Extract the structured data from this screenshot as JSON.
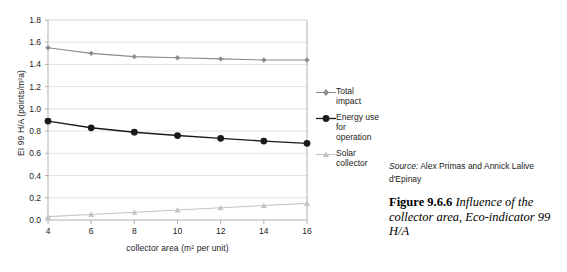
{
  "chart_data": {
    "type": "line",
    "title": "",
    "subtitle": "",
    "xlabel": "collector area (m² per unit)",
    "ylabel": "EI 99 H/A (points/m²a)",
    "x": [
      4,
      6,
      8,
      10,
      12,
      14,
      16
    ],
    "xlim": [
      4,
      16
    ],
    "ylim": [
      0.0,
      1.8
    ],
    "xticks": [
      "4",
      "6",
      "8",
      "10",
      "12",
      "14",
      "16"
    ],
    "yticks": [
      "0.0",
      "0.2",
      "0.4",
      "0.6",
      "0.8",
      "1.0",
      "1.2",
      "1.4",
      "1.6",
      "1.8"
    ],
    "grid": "horizontal",
    "legend_position": "right",
    "series": [
      {
        "name": "Total impact",
        "values": [
          1.55,
          1.5,
          1.47,
          1.46,
          1.45,
          1.44,
          1.44
        ],
        "color": "#8c8c8c",
        "marker": "diamond"
      },
      {
        "name": "Energy use for operation",
        "values": [
          0.89,
          0.83,
          0.79,
          0.76,
          0.735,
          0.71,
          0.69
        ],
        "color": "#1a1a1a",
        "marker": "circle"
      },
      {
        "name": "Solar collector",
        "values": [
          0.03,
          0.05,
          0.07,
          0.09,
          0.11,
          0.13,
          0.15
        ],
        "color": "#c4c4c4",
        "marker": "triangle"
      }
    ]
  },
  "legend": {
    "items": [
      {
        "label_line1": "Total",
        "label_line2": "impact",
        "label_line3": "",
        "marker": "diamond-marker",
        "color": "#8c8c8c"
      },
      {
        "label_line1": "Energy use",
        "label_line2": "for",
        "label_line3": "operation",
        "marker": "circle-marker",
        "color": "#1a1a1a"
      },
      {
        "label_line1": "Solar",
        "label_line2": "collector",
        "label_line3": "",
        "marker": "triangle-marker",
        "color": "#c4c4c4"
      }
    ]
  },
  "caption": {
    "source_prefix": "Source:",
    "source_text": " Alex Primas and Annick Lalive d'Epinay",
    "figure_number": "Figure 9.6.6",
    "figure_title": " Influence of the collector area, Eco-indicator 99 H/A"
  },
  "colors": {
    "axis": "#b0b0b0",
    "grid": "#e2e2e2",
    "text": "#222222",
    "total_impact": "#8c8c8c",
    "energy_use": "#1a1a1a",
    "solar_collector": "#c4c4c4"
  }
}
